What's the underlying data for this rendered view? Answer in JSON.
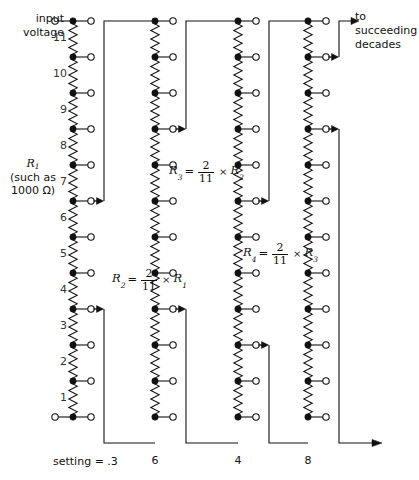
{
  "figure": {
    "type": "kelvin-varley-divider-schematic",
    "input_label": "input\nvoltage",
    "input_label_line1": "input",
    "input_label_line2": "voltage",
    "output_label_line1": "to",
    "output_label_line2": "succeeding",
    "output_label_line3": "decades",
    "r1_label_line1": "R",
    "r1_label_sub": "1",
    "r1_label_line2": "(such as",
    "r1_label_line3": "1000 Ω)",
    "setting_text": "setting  =  .3",
    "line_color": "#111111",
    "node_fill": "#111111",
    "terminal_fill": "#ffffff",
    "text_color": "#111111",
    "resistor_tick_color": "#333333"
  },
  "formulas": [
    {
      "id": "r2",
      "lhs_sym": "R",
      "lhs_sub": "2",
      "eq": "=",
      "frac_num": "2",
      "frac_den": "11",
      "times": "×",
      "rhs_sym": "R",
      "rhs_sub": "1",
      "x": 112,
      "y": 268
    },
    {
      "id": "r3",
      "lhs_sym": "R",
      "lhs_sub": "3",
      "eq": "=",
      "frac_num": "2",
      "frac_den": "11",
      "times": "×",
      "rhs_sym": "R",
      "rhs_sub": "2",
      "x": 169,
      "y": 160
    },
    {
      "id": "r4",
      "lhs_sym": "R",
      "lhs_sub": "4",
      "eq": "=",
      "frac_num": "2",
      "frac_den": "11",
      "times": "×",
      "rhs_sym": "R",
      "rhs_sub": "3",
      "x": 243,
      "y": 242
    }
  ],
  "columns": [
    {
      "id": "col1",
      "name": "decade-1",
      "spine_x": 73,
      "top_y": 21,
      "node_spacing": 36,
      "node_count": 12,
      "tap_x": 91,
      "has_left_input_terminal": true,
      "has_right_top_terminal": true,
      "has_bottom_left_terminal": true,
      "step_labels": [
        "11",
        "10",
        "9",
        "8",
        "7",
        "6",
        "5",
        "4",
        "3",
        "2",
        "1"
      ],
      "step_label_x": 62,
      "wiper_nodes": [
        5,
        8
      ],
      "bracket_x": 104,
      "bottom_label": "",
      "setting_digit": "3"
    },
    {
      "id": "col2",
      "name": "decade-2",
      "spine_x": 155,
      "top_y": 21,
      "node_spacing": 36,
      "node_count": 12,
      "tap_x": 173,
      "has_left_input_terminal": false,
      "has_right_top_terminal": true,
      "has_bottom_left_terminal": false,
      "step_labels": [],
      "step_label_x": 0,
      "wiper_nodes": [
        3,
        8
      ],
      "bracket_x": 186,
      "bottom_label": "6",
      "setting_digit": "6"
    },
    {
      "id": "col3",
      "name": "decade-3",
      "spine_x": 238,
      "top_y": 21,
      "node_spacing": 36,
      "node_count": 12,
      "tap_x": 256,
      "has_left_input_terminal": false,
      "has_right_top_terminal": true,
      "has_bottom_left_terminal": false,
      "step_labels": [],
      "step_label_x": 0,
      "wiper_nodes": [
        5,
        9
      ],
      "bracket_x": 269,
      "bottom_label": "4",
      "setting_digit": "4"
    },
    {
      "id": "col4",
      "name": "decade-4",
      "spine_x": 308,
      "top_y": 21,
      "node_spacing": 36,
      "node_count": 12,
      "tap_x": 326,
      "has_left_input_terminal": false,
      "has_right_top_terminal": true,
      "has_bottom_left_terminal": false,
      "step_labels": [],
      "step_label_x": 0,
      "wiper_nodes": [
        1,
        3
      ],
      "bracket_x": 339,
      "bottom_label": "8",
      "setting_digit": "8"
    }
  ],
  "bottom_rail_y": 443,
  "bottom_labels": [
    {
      "text": "6",
      "x": 155
    },
    {
      "text": "4",
      "x": 238
    },
    {
      "text": "8",
      "x": 308
    }
  ],
  "output_arrow": {
    "x1": 339,
    "y1": 443,
    "x2": 382,
    "y2": 443
  }
}
